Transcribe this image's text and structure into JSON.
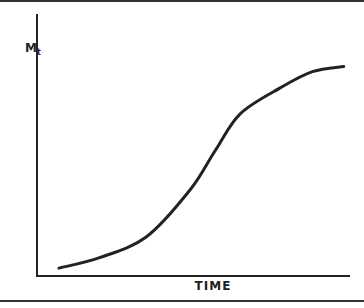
{
  "chart_data": {
    "type": "line",
    "title": "",
    "xlabel": "TIME",
    "ylabel": "M",
    "ylabel_subscript": "t",
    "grid": false,
    "legend": null,
    "series": [
      {
        "name": "M_t",
        "shape": "sigmoid",
        "x": [
          0.07,
          0.2,
          0.35,
          0.49,
          0.57,
          0.65,
          0.78,
          0.88,
          0.98
        ],
        "y": [
          0.03,
          0.07,
          0.15,
          0.33,
          0.48,
          0.62,
          0.72,
          0.78,
          0.8
        ]
      }
    ],
    "xlim": [
      0,
      1
    ],
    "ylim": [
      0,
      1
    ]
  }
}
